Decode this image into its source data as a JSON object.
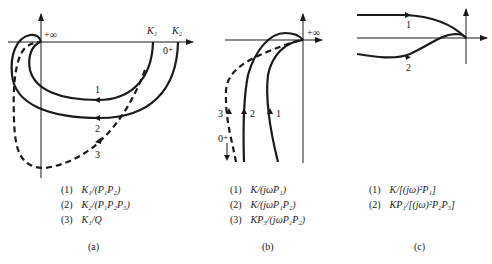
{
  "panels": [
    {
      "id": "a",
      "caption": "(a)",
      "axis_labels": {
        "infinity": "+∞",
        "k1": "K₁",
        "k2": "K₂",
        "zero": "0⁺"
      },
      "curve_labels": [
        "1",
        "2",
        "3"
      ],
      "legend": [
        {
          "num": "(1)",
          "expr": "K₁/(P₁P₂)"
        },
        {
          "num": "(2)",
          "expr": "K₂/(P₁P₂P₃)"
        },
        {
          "num": "(3)",
          "expr": "K₁/Q"
        }
      ]
    },
    {
      "id": "b",
      "caption": "(b)",
      "axis_labels": {
        "infinity": "+∞",
        "zero": "0⁺"
      },
      "curve_labels": [
        "1",
        "2",
        "3"
      ],
      "legend": [
        {
          "num": "(1)",
          "expr": "K/(jωP₁)"
        },
        {
          "num": "(2)",
          "expr": "K/(jωP₁P₂)"
        },
        {
          "num": "(3)",
          "expr": "KP₃/(jωP₁P₂)"
        }
      ]
    },
    {
      "id": "c",
      "caption": "(c)",
      "curve_labels": [
        "1",
        "2"
      ],
      "legend": [
        {
          "num": "(1)",
          "expr": "K/[(jω)²P₁]"
        },
        {
          "num": "(2)",
          "expr": "KP₁/[(jω)²P₂P₃]"
        }
      ]
    }
  ]
}
